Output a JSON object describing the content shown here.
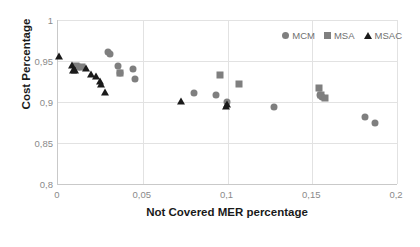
{
  "chart_data": {
    "type": "scatter",
    "title": "",
    "xlabel": "Not Covered MER percentage",
    "ylabel": "Cost Percentage",
    "xlim": [
      0,
      0.2
    ],
    "ylim": [
      0.8,
      1
    ],
    "xticks": [
      "0",
      "0,05",
      "0,1",
      "0,15",
      "0,2"
    ],
    "xtick_values": [
      0,
      0.05,
      0.1,
      0.15,
      0.2
    ],
    "yticks": [
      "0,8",
      "0,85",
      "0,9",
      "0,95",
      "1"
    ],
    "ytick_values": [
      0.8,
      0.85,
      0.9,
      0.95,
      1
    ],
    "grid": true,
    "legend_position": "top-right",
    "series": [
      {
        "name": "MCM",
        "marker": "circle",
        "color": "#7f7f7f",
        "points": [
          [
            0.0295,
            0.9605
          ],
          [
            0.0305,
            0.9585
          ],
          [
            0.0355,
            0.9445
          ],
          [
            0.0365,
            0.9355
          ],
          [
            0.0445,
            0.9405
          ],
          [
            0.0455,
            0.9285
          ],
          [
            0.08,
            0.911
          ],
          [
            0.0935,
            0.9085
          ],
          [
            0.0995,
            0.8995
          ],
          [
            0.1275,
            0.8945
          ],
          [
            0.1545,
            0.9085
          ],
          [
            0.1555,
            0.906
          ],
          [
            0.181,
            0.8815
          ],
          [
            0.187,
            0.8745
          ]
        ]
      },
      {
        "name": "MSA",
        "marker": "square",
        "color": "#7f7f7f",
        "points": [
          [
            0.0105,
            0.944
          ],
          [
            0.0115,
            0.943
          ],
          [
            0.014,
            0.9425
          ],
          [
            0.0365,
            0.9355
          ],
          [
            0.0955,
            0.9335
          ],
          [
            0.1065,
            0.9215
          ],
          [
            0.154,
            0.917
          ],
          [
            0.155,
            0.909
          ],
          [
            0.1575,
            0.9045
          ]
        ]
      },
      {
        "name": "MSAC",
        "marker": "triangle",
        "color": "#1a1a1a",
        "points": [
          [
            0.0005,
            0.9555
          ],
          [
            0.0085,
            0.945
          ],
          [
            0.009,
            0.9395
          ],
          [
            0.01,
            0.9385
          ],
          [
            0.0165,
            0.941
          ],
          [
            0.0195,
            0.934
          ],
          [
            0.0225,
            0.932
          ],
          [
            0.0245,
            0.9255
          ],
          [
            0.0255,
            0.9215
          ],
          [
            0.0275,
            0.9125
          ],
          [
            0.0725,
            0.901
          ],
          [
            0.099,
            0.8955
          ],
          [
            0.0995,
            0.8975
          ]
        ]
      }
    ]
  },
  "legend": [
    {
      "label": "MCM",
      "marker": "circle"
    },
    {
      "label": "MSA",
      "marker": "square"
    },
    {
      "label": "MSAC",
      "marker": "triangle"
    }
  ]
}
